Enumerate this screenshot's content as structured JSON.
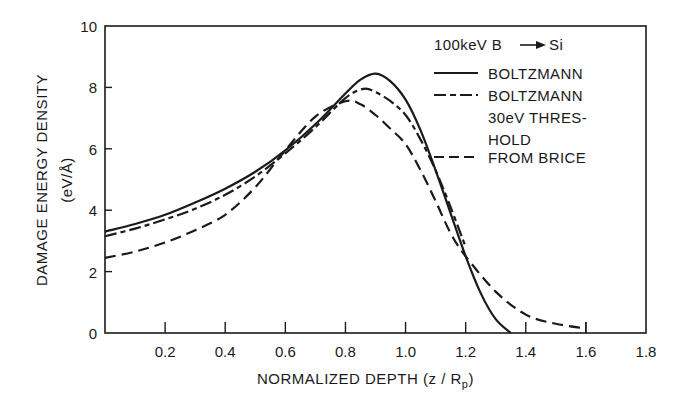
{
  "chart_data": {
    "type": "line",
    "title": "",
    "annotation": "100keV B → Si",
    "xlabel": "NORMALIZED DEPTH (z/Rp)",
    "xlabel_parts": {
      "main": "NORMALIZED DEPTH (z / R",
      "sub": "p",
      "close": ")"
    },
    "ylabel": "DAMAGE ENERGY DENSITY",
    "ylabel_units": "(eV/Å)",
    "xlim": [
      0,
      1.8
    ],
    "ylim": [
      0,
      10
    ],
    "xticks": [
      0.2,
      0.4,
      0.6,
      0.8,
      1.0,
      1.2,
      1.4,
      1.6,
      1.8
    ],
    "xtick_labels": [
      "0.2",
      "0.4",
      "0.6",
      "0.8",
      "1.0",
      "1.2",
      "1.4",
      "1.6",
      "1.8"
    ],
    "yticks": [
      0,
      2,
      4,
      6,
      8,
      10
    ],
    "ytick_labels": [
      "0",
      "2",
      "4",
      "6",
      "8",
      "10"
    ],
    "grid": false,
    "legend_position": "upper right (inside)",
    "series": [
      {
        "name": "BOLTZMANN",
        "style": "solid",
        "x": [
          0.0,
          0.1,
          0.2,
          0.3,
          0.4,
          0.5,
          0.6,
          0.7,
          0.8,
          0.85,
          0.9,
          0.95,
          1.0,
          1.05,
          1.1,
          1.15,
          1.2,
          1.25,
          1.3,
          1.35
        ],
        "values": [
          3.3,
          3.55,
          3.85,
          4.25,
          4.7,
          5.25,
          5.95,
          6.8,
          7.8,
          8.25,
          8.45,
          8.2,
          7.6,
          6.6,
          5.3,
          3.9,
          2.5,
          1.3,
          0.45,
          0.0
        ]
      },
      {
        "name": "BOLTZMANN 30eV THRESHOLD",
        "style": "dash-dot",
        "x": [
          0.0,
          0.1,
          0.2,
          0.3,
          0.4,
          0.5,
          0.6,
          0.7,
          0.8,
          0.86,
          0.9,
          0.95,
          1.0,
          1.05,
          1.1,
          1.15,
          1.2
        ],
        "values": [
          3.15,
          3.4,
          3.7,
          4.05,
          4.5,
          5.1,
          5.85,
          6.7,
          7.65,
          7.95,
          7.85,
          7.55,
          7.1,
          6.3,
          5.3,
          4.1,
          2.8
        ]
      },
      {
        "name": "FROM BRICE",
        "style": "dashed",
        "x": [
          0.0,
          0.1,
          0.2,
          0.3,
          0.4,
          0.5,
          0.6,
          0.7,
          0.8,
          0.85,
          0.9,
          0.95,
          1.0,
          1.05,
          1.1,
          1.15,
          1.2,
          1.3,
          1.4,
          1.5,
          1.6
        ],
        "values": [
          2.45,
          2.65,
          2.95,
          3.35,
          3.85,
          4.75,
          5.95,
          7.05,
          7.55,
          7.45,
          7.1,
          6.65,
          6.15,
          5.3,
          4.3,
          3.25,
          2.5,
          1.35,
          0.6,
          0.3,
          0.15
        ]
      }
    ]
  },
  "legend": {
    "header": {
      "prefix": "100keV B",
      "suffix": "Si"
    },
    "entries": [
      {
        "lines": [
          "BOLTZMANN"
        ],
        "style": "solid"
      },
      {
        "lines": [
          "BOLTZMANN",
          "30eV THRES-",
          "HOLD"
        ],
        "style": "dash-dot"
      },
      {
        "lines": [
          "FROM BRICE"
        ],
        "style": "dashed"
      }
    ]
  },
  "colors": {
    "ink": "#1a1a1a",
    "background": "#ffffff"
  },
  "plot_area": {
    "left": 105,
    "right": 646,
    "top": 26,
    "bottom": 333
  }
}
